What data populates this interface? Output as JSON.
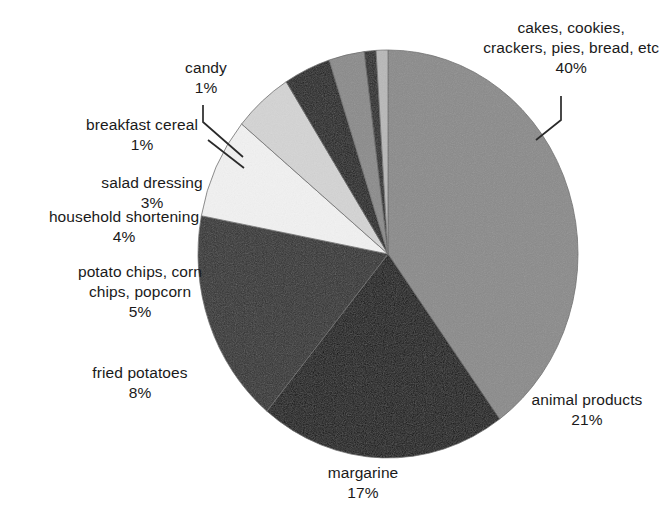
{
  "chart_data": {
    "type": "pie",
    "title": "",
    "subtitle": "",
    "xlabel": "",
    "ylabel": "",
    "legend_position": "callout-labels",
    "grid": false,
    "total": 100,
    "unit": "%",
    "categories": [
      "cakes, cookies, crackers, pies, bread, etc",
      "animal products",
      "margarine",
      "fried potatoes",
      "potato chips, corn chips, popcorn",
      "household shortening",
      "salad dressing",
      "breakfast cereal",
      "candy"
    ],
    "values": [
      40,
      21,
      17,
      8,
      5,
      4,
      3,
      1,
      1
    ],
    "slices": [
      {
        "id": "cakes",
        "label_lines": [
          "cakes, cookies,",
          "crackers, pies, bread, etc"
        ],
        "value_text": "40%",
        "value": 40,
        "color": "#8a8a8a"
      },
      {
        "id": "animal-products",
        "label_lines": [
          "animal products"
        ],
        "value_text": "21%",
        "value": 21,
        "color": "#101010"
      },
      {
        "id": "margarine",
        "label_lines": [
          "margarine"
        ],
        "value_text": "17%",
        "value": 17,
        "color": "#303030"
      },
      {
        "id": "fried-potatoes",
        "label_lines": [
          "fried potatoes"
        ],
        "value_text": "8%",
        "value": 8,
        "color": "#f2f2f2"
      },
      {
        "id": "potato-chips",
        "label_lines": [
          "potato chips, corn",
          "chips, popcorn"
        ],
        "value_text": "5%",
        "value": 5,
        "color": "#d4d4d4"
      },
      {
        "id": "household-shortening",
        "label_lines": [
          "household shortening"
        ],
        "value_text": "4%",
        "value": 4,
        "color": "#1e1e1e"
      },
      {
        "id": "salad-dressing",
        "label_lines": [
          "salad dressing"
        ],
        "value_text": "3%",
        "value": 3,
        "color": "#8a8a8a"
      },
      {
        "id": "breakfast-cereal",
        "label_lines": [
          "breakfast cereal"
        ],
        "value_text": "1%",
        "value": 1,
        "color": "#262626"
      },
      {
        "id": "candy",
        "label_lines": [
          "candy"
        ],
        "value_text": "1%",
        "value": 1,
        "color": "#b8b8b8"
      }
    ]
  },
  "labels": {
    "cakes": {
      "line1": "cakes, cookies,",
      "line2": "crackers, pies, bread, etc",
      "pct": "40%"
    },
    "candy": {
      "line1": "candy",
      "pct": "1%"
    },
    "breakfast_cereal": {
      "line1": "breakfast cereal",
      "pct": "1%"
    },
    "salad_dressing": {
      "line1": "salad dressing",
      "pct": "3%"
    },
    "household_shortening": {
      "line1": "household shortening",
      "pct": "4%"
    },
    "potato_chips": {
      "line1": "potato chips, corn",
      "line2": "chips, popcorn",
      "pct": "5%"
    },
    "fried_potatoes": {
      "line1": "fried potatoes",
      "pct": "8%"
    },
    "margarine": {
      "line1": "margarine",
      "pct": "17%"
    },
    "animal_products": {
      "line1": "animal products",
      "pct": "21%"
    }
  },
  "geometry": {
    "center_x": 388,
    "center_y": 254,
    "radius_x": 190,
    "radius_y": 204,
    "start_angle_deg": -90,
    "direction": "clockwise"
  },
  "colors": {
    "background": "#ffffff",
    "text": "#1a1a1a",
    "leader_line": "#2a2a2a",
    "slice_outline": "#6a6a6a"
  }
}
